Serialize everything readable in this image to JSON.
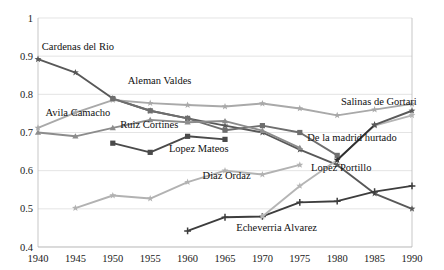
{
  "chart_data": {
    "type": "line",
    "title": "",
    "xlabel": "",
    "ylabel": "",
    "xlim": [
      1940,
      1990
    ],
    "ylim": [
      0.4,
      1.0
    ],
    "xticks": [
      1940,
      1945,
      1950,
      1955,
      1960,
      1965,
      1970,
      1975,
      1980,
      1985,
      1990
    ],
    "yticks": [
      0.4,
      0.5,
      0.6,
      0.7,
      0.8,
      0.9,
      1
    ],
    "ytick_labels": [
      "0.4",
      "0.5",
      "0.6",
      "0.7",
      "0.8",
      "0.9",
      "1"
    ],
    "xtick_labels": [
      "1940",
      "1945",
      "1950",
      "1955",
      "1960",
      "1965",
      "1970",
      "1975",
      "1980",
      "1985",
      "1990"
    ],
    "grid": true,
    "legend": "annotations-inline",
    "series": [
      {
        "name": "Cardenas del Rio",
        "color": "#585858",
        "marker": "star",
        "x": [
          1940,
          1945,
          1950,
          1955,
          1960,
          1965,
          1970,
          1975,
          1980,
          1985,
          1990
        ],
        "values": [
          0.892,
          0.857,
          0.789,
          0.757,
          0.737,
          0.718,
          0.7,
          0.655,
          0.615,
          0.54,
          0.5
        ]
      },
      {
        "name": "Avila Camacho",
        "color": "#a9a9a9",
        "marker": "star",
        "x": [
          1940,
          1945,
          1950,
          1955,
          1960,
          1965,
          1970,
          1975,
          1980,
          1985,
          1990
        ],
        "values": [
          0.712,
          0.752,
          0.785,
          0.777,
          0.772,
          0.768,
          0.776,
          0.763,
          0.745,
          0.76,
          0.775
        ]
      },
      {
        "name": "Aleman Valdes",
        "color": "#6e6e6e",
        "marker": "square",
        "x": [
          1950,
          1955,
          1960,
          1965,
          1970,
          1975,
          1980
        ],
        "values": [
          0.789,
          0.757,
          0.737,
          0.706,
          0.718,
          0.7,
          0.64
        ]
      },
      {
        "name": "Ruiz Cortines",
        "color": "#8c8c8c",
        "marker": "triangle",
        "x": [
          1940,
          1945,
          1950,
          1955,
          1960,
          1965,
          1970,
          1975
        ],
        "values": [
          0.7,
          0.69,
          0.712,
          0.733,
          0.727,
          0.73,
          0.705,
          0.66
        ]
      },
      {
        "name": "Lopez Mateos",
        "color": "#4a4a4a",
        "marker": "square",
        "x": [
          1950,
          1955,
          1960,
          1965
        ],
        "values": [
          0.672,
          0.648,
          0.69,
          0.682
        ]
      },
      {
        "name": "Diaz Ordaz",
        "color": "#b2b2b2",
        "marker": "star",
        "x": [
          1945,
          1950,
          1955,
          1960,
          1965,
          1970,
          1975
        ],
        "values": [
          0.502,
          0.535,
          0.527,
          0.57,
          0.6,
          0.59,
          0.615
        ]
      },
      {
        "name": "Echeverria Alvarez",
        "color": "#3d3d3d",
        "marker": "plus",
        "x": [
          1960,
          1965,
          1970,
          1975,
          1980,
          1985,
          1990
        ],
        "values": [
          0.442,
          0.478,
          0.48,
          0.517,
          0.52,
          0.545,
          0.56
        ]
      },
      {
        "name": "Lopez Portillo",
        "color": "#b5b5b5",
        "marker": "star",
        "x": [
          1970,
          1975,
          1980,
          1985,
          1990
        ],
        "values": [
          0.48,
          0.56,
          0.628,
          0.718,
          0.745
        ]
      },
      {
        "name": "De la madrid hurtado",
        "color": "#2f2f2f",
        "marker": "star",
        "x": [
          1980,
          1985
        ],
        "values": [
          0.628,
          0.72
        ]
      },
      {
        "name": "Salinas de Gortari",
        "color": "#5a5a5a",
        "marker": "star",
        "x": [
          1985,
          1990
        ],
        "values": [
          0.72,
          0.757
        ]
      }
    ],
    "annotations": [
      {
        "text": "Cardenas del Rio",
        "x": 1940.5,
        "y": 0.915,
        "anchor": "start"
      },
      {
        "text": "Aleman Valdes",
        "x": 1952.0,
        "y": 0.828,
        "anchor": "start"
      },
      {
        "text": "Avila Camacho",
        "x": 1941.0,
        "y": 0.742,
        "anchor": "start"
      },
      {
        "text": "Ruiz Cortines",
        "x": 1951.0,
        "y": 0.712,
        "anchor": "start"
      },
      {
        "text": "Lopez Mateos",
        "x": 1957.5,
        "y": 0.648,
        "anchor": "start"
      },
      {
        "text": "Diaz Ordaz",
        "x": 1962.0,
        "y": 0.578,
        "anchor": "start"
      },
      {
        "text": "Echeverria Alvarez",
        "x": 1966.5,
        "y": 0.442,
        "anchor": "start"
      },
      {
        "text": "Lopez Portillo",
        "x": 1976.5,
        "y": 0.598,
        "anchor": "start"
      },
      {
        "text": "De la madrid hurtado",
        "x": 1976.0,
        "y": 0.678,
        "anchor": "start"
      },
      {
        "text": "Salinas de Gortari",
        "x": 1980.5,
        "y": 0.772,
        "anchor": "start"
      }
    ]
  }
}
